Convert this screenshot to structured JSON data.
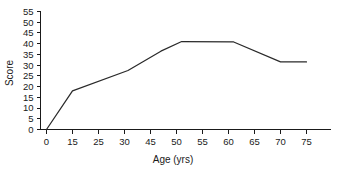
{
  "chart_data": {
    "type": "line",
    "title": "",
    "subtitle": "",
    "xlabel": "Age (yrs)",
    "ylabel": "Score",
    "xlim": [
      0,
      80
    ],
    "ylim": [
      0,
      55
    ],
    "grid": false,
    "legend": false,
    "legend_position": "none",
    "line_color": "#2a2a2a",
    "background_color": "#ffffff",
    "axis_color": "#1a1a1a",
    "x_tick_labels": [
      "0",
      "15",
      "25",
      "30",
      "45",
      "50",
      "55",
      "60",
      "65",
      "70",
      "75"
    ],
    "x_tick_values": [
      0,
      15,
      25,
      30,
      45,
      50,
      55,
      60,
      65,
      70,
      75
    ],
    "y_tick_labels": [
      "0",
      "5",
      "10",
      "15",
      "20",
      "25",
      "30",
      "35",
      "40",
      "45",
      "50",
      "55"
    ],
    "y_tick_values": [
      0,
      5,
      10,
      15,
      20,
      25,
      30,
      35,
      40,
      45,
      50,
      55
    ],
    "series": [
      {
        "name": "Score",
        "x": [
          0,
          15,
          32,
          47,
          51,
          61,
          70,
          75
        ],
        "values": [
          0,
          18,
          27.5,
          36.5,
          41,
          40.8,
          31.5,
          31.5
        ]
      }
    ],
    "annotations": []
  },
  "axis_titles": {
    "y": "Score",
    "x": "Age (yrs)"
  }
}
